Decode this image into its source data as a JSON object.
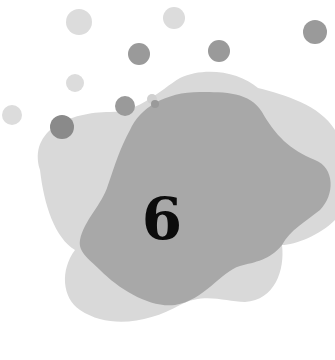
{
  "illustration": {
    "number_label": "6",
    "colors": {
      "background": "#ffffff",
      "light_blob": "#d9d9d9",
      "dark_blob": "#a8a8a8",
      "light_dot": "#dcdcdc",
      "dark_dot": "#9a9a9a",
      "numeral": "#0c0c0c"
    },
    "icons": [
      "light-blob-shape",
      "dark-blob-shape",
      "decorative-dots"
    ]
  }
}
